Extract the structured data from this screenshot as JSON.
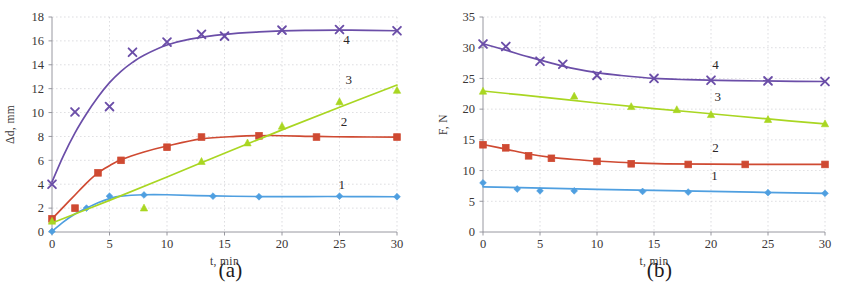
{
  "figure": {
    "panels": [
      {
        "caption": "(a)",
        "xlabel": "t,  min",
        "ylabel": "Δd,  mm"
      },
      {
        "caption": "(b)",
        "xlabel": "t,  min",
        "ylabel": "F,  N"
      }
    ]
  },
  "colors": {
    "series1": "#4f9fe0",
    "series2": "#cf4a32",
    "series3": "#a9d622",
    "series4": "#6b4ea8",
    "grid": "#c9c9cf",
    "axis": "#8d8d95",
    "text": "#34302f"
  },
  "chart_data": [
    {
      "type": "scatter",
      "title": "(a)",
      "xlabel": "t,  min",
      "ylabel": "Δd,  mm",
      "xlim": [
        0,
        30
      ],
      "ylim": [
        0,
        18
      ],
      "xticks": [
        0,
        5,
        10,
        15,
        20,
        25,
        30
      ],
      "yticks": [
        0,
        2,
        4,
        6,
        8,
        10,
        12,
        14,
        16,
        18
      ],
      "grid": true,
      "legend": "inline-labels",
      "series": [
        {
          "name": "1",
          "label": "1",
          "color": "#4f9fe0",
          "marker": "diamond",
          "label_pos": {
            "x": 25.2,
            "y": 3.6
          },
          "points": [
            {
              "x": 0,
              "y": 0.05
            },
            {
              "x": 3,
              "y": 2.0
            },
            {
              "x": 5,
              "y": 3.0
            },
            {
              "x": 8,
              "y": 3.1
            },
            {
              "x": 14,
              "y": 3.0
            },
            {
              "x": 18,
              "y": 2.95
            },
            {
              "x": 25,
              "y": 3.0
            },
            {
              "x": 30,
              "y": 2.95
            }
          ],
          "fit": [
            {
              "x": 0,
              "y": 0.05
            },
            {
              "x": 1,
              "y": 0.85
            },
            {
              "x": 2,
              "y": 1.5
            },
            {
              "x": 3,
              "y": 2.0
            },
            {
              "x": 4,
              "y": 2.45
            },
            {
              "x": 5,
              "y": 2.8
            },
            {
              "x": 6,
              "y": 3.0
            },
            {
              "x": 8,
              "y": 3.12
            },
            {
              "x": 10,
              "y": 3.12
            },
            {
              "x": 14,
              "y": 3.02
            },
            {
              "x": 18,
              "y": 2.97
            },
            {
              "x": 22,
              "y": 2.97
            },
            {
              "x": 26,
              "y": 2.97
            },
            {
              "x": 30,
              "y": 2.95
            }
          ]
        },
        {
          "name": "2",
          "label": "2",
          "color": "#cf4a32",
          "marker": "square",
          "label_pos": {
            "x": 25.4,
            "y": 8.9
          },
          "points": [
            {
              "x": 0,
              "y": 1.1
            },
            {
              "x": 2,
              "y": 2.0
            },
            {
              "x": 4,
              "y": 4.95
            },
            {
              "x": 6,
              "y": 6.0
            },
            {
              "x": 10,
              "y": 7.1
            },
            {
              "x": 13,
              "y": 7.95
            },
            {
              "x": 18,
              "y": 8.05
            },
            {
              "x": 23,
              "y": 7.95
            },
            {
              "x": 30,
              "y": 7.95
            }
          ],
          "fit": [
            {
              "x": 0,
              "y": 1.1
            },
            {
              "x": 1,
              "y": 2.1
            },
            {
              "x": 2,
              "y": 3.1
            },
            {
              "x": 3,
              "y": 4.1
            },
            {
              "x": 4,
              "y": 4.95
            },
            {
              "x": 5,
              "y": 5.55
            },
            {
              "x": 6,
              "y": 6.05
            },
            {
              "x": 8,
              "y": 6.7
            },
            {
              "x": 10,
              "y": 7.2
            },
            {
              "x": 13,
              "y": 7.8
            },
            {
              "x": 16,
              "y": 8.0
            },
            {
              "x": 19,
              "y": 8.08
            },
            {
              "x": 23,
              "y": 8.0
            },
            {
              "x": 26,
              "y": 7.96
            },
            {
              "x": 30,
              "y": 7.95
            }
          ]
        },
        {
          "name": "3",
          "label": "3",
          "color": "#a9d622",
          "marker": "triangle",
          "label_pos": {
            "x": 25.8,
            "y": 12.4
          },
          "points": [
            {
              "x": 0,
              "y": 0.9
            },
            {
              "x": 8,
              "y": 2.0
            },
            {
              "x": 13,
              "y": 5.9
            },
            {
              "x": 17,
              "y": 7.45
            },
            {
              "x": 20,
              "y": 8.85
            },
            {
              "x": 25,
              "y": 10.9
            },
            {
              "x": 30,
              "y": 11.85
            }
          ],
          "fit": [
            {
              "x": 0,
              "y": 0.75
            },
            {
              "x": 5,
              "y": 2.65
            },
            {
              "x": 10,
              "y": 4.6
            },
            {
              "x": 15,
              "y": 6.6
            },
            {
              "x": 20,
              "y": 8.55
            },
            {
              "x": 25,
              "y": 10.45
            },
            {
              "x": 30,
              "y": 12.3
            }
          ]
        },
        {
          "name": "4",
          "label": "4",
          "color": "#6b4ea8",
          "marker": "cross",
          "label_pos": {
            "x": 25.6,
            "y": 15.75
          },
          "points": [
            {
              "x": 0,
              "y": 4.0
            },
            {
              "x": 2,
              "y": 10.05
            },
            {
              "x": 5,
              "y": 10.5
            },
            {
              "x": 7,
              "y": 15.05
            },
            {
              "x": 10,
              "y": 15.9
            },
            {
              "x": 13,
              "y": 16.55
            },
            {
              "x": 15,
              "y": 16.4
            },
            {
              "x": 20,
              "y": 16.9
            },
            {
              "x": 25,
              "y": 16.95
            },
            {
              "x": 30,
              "y": 16.85
            }
          ],
          "fit": [
            {
              "x": 0,
              "y": 4.2
            },
            {
              "x": 1,
              "y": 6.4
            },
            {
              "x": 2,
              "y": 8.3
            },
            {
              "x": 3,
              "y": 9.9
            },
            {
              "x": 4,
              "y": 11.3
            },
            {
              "x": 5,
              "y": 12.5
            },
            {
              "x": 6,
              "y": 13.45
            },
            {
              "x": 7,
              "y": 14.2
            },
            {
              "x": 8,
              "y": 14.8
            },
            {
              "x": 10,
              "y": 15.65
            },
            {
              "x": 12,
              "y": 16.15
            },
            {
              "x": 15,
              "y": 16.55
            },
            {
              "x": 18,
              "y": 16.75
            },
            {
              "x": 22,
              "y": 16.88
            },
            {
              "x": 26,
              "y": 16.9
            },
            {
              "x": 30,
              "y": 16.85
            }
          ]
        }
      ]
    },
    {
      "type": "scatter",
      "title": "(b)",
      "xlabel": "t,  min",
      "ylabel": "F,  N",
      "xlim": [
        0,
        30
      ],
      "ylim": [
        0,
        35
      ],
      "xticks": [
        0,
        5,
        10,
        15,
        20,
        25,
        30
      ],
      "yticks": [
        0,
        5,
        10,
        15,
        20,
        25,
        30,
        35
      ],
      "grid": true,
      "legend": "inline-labels",
      "series": [
        {
          "name": "1",
          "label": "1",
          "color": "#4f9fe0",
          "marker": "diamond",
          "label_pos": {
            "x": 20.3,
            "y": 8.5
          },
          "points": [
            {
              "x": 0,
              "y": 8.0
            },
            {
              "x": 3,
              "y": 7.0
            },
            {
              "x": 5,
              "y": 6.7
            },
            {
              "x": 8,
              "y": 6.7
            },
            {
              "x": 14,
              "y": 6.6
            },
            {
              "x": 18,
              "y": 6.5
            },
            {
              "x": 25,
              "y": 6.4
            },
            {
              "x": 30,
              "y": 6.3
            }
          ],
          "fit": [
            {
              "x": 0,
              "y": 7.35
            },
            {
              "x": 10,
              "y": 6.95
            },
            {
              "x": 20,
              "y": 6.6
            },
            {
              "x": 30,
              "y": 6.3
            }
          ]
        },
        {
          "name": "2",
          "label": "2",
          "color": "#cf4a32",
          "marker": "square",
          "label_pos": {
            "x": 20.4,
            "y": 13.1
          },
          "points": [
            {
              "x": 0,
              "y": 14.2
            },
            {
              "x": 2,
              "y": 13.7
            },
            {
              "x": 4,
              "y": 12.4
            },
            {
              "x": 6,
              "y": 12.0
            },
            {
              "x": 10,
              "y": 11.5
            },
            {
              "x": 13,
              "y": 11.1
            },
            {
              "x": 18,
              "y": 11.0
            },
            {
              "x": 23,
              "y": 11.0
            },
            {
              "x": 30,
              "y": 11.0
            }
          ],
          "fit": [
            {
              "x": 0,
              "y": 14.25
            },
            {
              "x": 2,
              "y": 13.5
            },
            {
              "x": 4,
              "y": 12.7
            },
            {
              "x": 6,
              "y": 12.15
            },
            {
              "x": 8,
              "y": 11.8
            },
            {
              "x": 10,
              "y": 11.55
            },
            {
              "x": 13,
              "y": 11.25
            },
            {
              "x": 16,
              "y": 11.1
            },
            {
              "x": 20,
              "y": 11.05
            },
            {
              "x": 25,
              "y": 11.0
            },
            {
              "x": 30,
              "y": 11.0
            }
          ]
        },
        {
          "name": "3",
          "label": "3",
          "color": "#a9d622",
          "marker": "triangle",
          "label_pos": {
            "x": 20.6,
            "y": 21.4
          },
          "points": [
            {
              "x": 0,
              "y": 22.9
            },
            {
              "x": 8,
              "y": 22.1
            },
            {
              "x": 13,
              "y": 20.4
            },
            {
              "x": 17,
              "y": 19.9
            },
            {
              "x": 20,
              "y": 19.1
            },
            {
              "x": 25,
              "y": 18.3
            },
            {
              "x": 30,
              "y": 17.6
            }
          ],
          "fit": [
            {
              "x": 0,
              "y": 22.95
            },
            {
              "x": 5,
              "y": 22.0
            },
            {
              "x": 10,
              "y": 21.0
            },
            {
              "x": 15,
              "y": 20.1
            },
            {
              "x": 20,
              "y": 19.25
            },
            {
              "x": 25,
              "y": 18.4
            },
            {
              "x": 30,
              "y": 17.6
            }
          ]
        },
        {
          "name": "4",
          "label": "4",
          "color": "#6b4ea8",
          "marker": "cross",
          "label_pos": {
            "x": 20.4,
            "y": 26.6
          },
          "points": [
            {
              "x": 0,
              "y": 30.6
            },
            {
              "x": 2,
              "y": 30.2
            },
            {
              "x": 5,
              "y": 27.8
            },
            {
              "x": 7,
              "y": 27.3
            },
            {
              "x": 10,
              "y": 25.5
            },
            {
              "x": 15,
              "y": 25.0
            },
            {
              "x": 20,
              "y": 24.7
            },
            {
              "x": 25,
              "y": 24.6
            },
            {
              "x": 30,
              "y": 24.5
            }
          ],
          "fit": [
            {
              "x": 0,
              "y": 30.65
            },
            {
              "x": 2,
              "y": 29.6
            },
            {
              "x": 4,
              "y": 28.5
            },
            {
              "x": 6,
              "y": 27.5
            },
            {
              "x": 8,
              "y": 26.6
            },
            {
              "x": 10,
              "y": 25.95
            },
            {
              "x": 12,
              "y": 25.5
            },
            {
              "x": 15,
              "y": 25.0
            },
            {
              "x": 18,
              "y": 24.8
            },
            {
              "x": 22,
              "y": 24.65
            },
            {
              "x": 26,
              "y": 24.55
            },
            {
              "x": 30,
              "y": 24.5
            }
          ]
        }
      ]
    }
  ]
}
